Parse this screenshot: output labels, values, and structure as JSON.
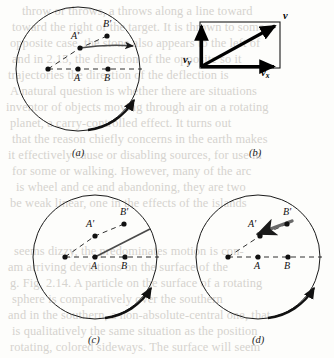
{
  "figure": {
    "background_color": "#fdfdfb",
    "ink_color": "#1a1a1a",
    "width": 334,
    "height": 358
  },
  "panels": [
    {
      "id": "a",
      "label": "(a)",
      "label_x": 72,
      "label_y": 147,
      "type": "rotating-disk",
      "circle": {
        "cx": 78,
        "cy": 69,
        "r": 62
      },
      "points": [
        {
          "name": "center",
          "label": "",
          "x": 48,
          "y": 69
        },
        {
          "name": "A",
          "label": "A",
          "x": 78,
          "y": 69,
          "label_x": 74,
          "label_y": 72
        },
        {
          "name": "B",
          "label": "B",
          "x": 108,
          "y": 69,
          "label_x": 104,
          "label_y": 72
        },
        {
          "name": "A-prime",
          "label": "A'",
          "x": 80,
          "y": 48,
          "label_x": 71,
          "label_y": 30
        },
        {
          "name": "B-prime",
          "label": "B'",
          "x": 107,
          "y": 36,
          "label_x": 103,
          "label_y": 18
        }
      ],
      "rotation_arrow": "counterclockwise-bottom-right",
      "motion_arrow": "curved-right-from-A-prime"
    },
    {
      "id": "b",
      "label": "(b)",
      "label_x": 249,
      "label_y": 147,
      "type": "vector-decomposition",
      "rect": {
        "x": 200,
        "y": 22,
        "w": 80,
        "h": 46
      },
      "vectors": [
        {
          "name": "v",
          "label": "v",
          "subscript": "",
          "label_x": 283,
          "label_y": 14
        },
        {
          "name": "v-y",
          "label": "v",
          "subscript": "y",
          "label_x": 183,
          "label_y": 58
        },
        {
          "name": "v-x",
          "label": "v",
          "subscript": "x",
          "label_x": 261,
          "label_y": 71
        }
      ]
    },
    {
      "id": "c",
      "label": "(c)",
      "label_x": 88,
      "label_y": 334,
      "type": "rotating-disk",
      "circle": {
        "cx": 95,
        "cy": 257,
        "r": 62
      },
      "points": [
        {
          "name": "center",
          "label": "",
          "x": 65,
          "y": 257
        },
        {
          "name": "A",
          "label": "A",
          "x": 95,
          "y": 257,
          "label_x": 91,
          "label_y": 260
        },
        {
          "name": "B",
          "label": "B",
          "x": 125,
          "y": 257,
          "label_x": 121,
          "label_y": 260
        },
        {
          "name": "A-prime",
          "label": "A'",
          "x": 95,
          "y": 236,
          "label_x": 86,
          "label_y": 218
        },
        {
          "name": "B-prime",
          "label": "B'",
          "x": 124,
          "y": 224,
          "label_x": 120,
          "label_y": 206
        }
      ],
      "rotation_arrow": "counterclockwise-bottom-right",
      "motion_arrow": "straight-from-A-to-rim"
    },
    {
      "id": "d",
      "label": "(d)",
      "label_x": 252,
      "label_y": 334,
      "type": "rotating-disk",
      "circle": {
        "cx": 258,
        "cy": 257,
        "r": 62
      },
      "points": [
        {
          "name": "center",
          "label": "",
          "x": 228,
          "y": 257
        },
        {
          "name": "A",
          "label": "A",
          "x": 258,
          "y": 257,
          "label_x": 254,
          "label_y": 260
        },
        {
          "name": "B",
          "label": "B",
          "x": 288,
          "y": 257,
          "label_x": 284,
          "label_y": 260
        },
        {
          "name": "A-prime",
          "label": "A'",
          "x": 260,
          "y": 236,
          "label_x": 248,
          "label_y": 218
        },
        {
          "name": "B-prime",
          "label": "B'",
          "x": 287,
          "y": 224,
          "label_x": 283,
          "label_y": 206
        }
      ],
      "rotation_arrow": "counterclockwise-bottom-right",
      "motion_arrow": "curved-left-toward-A-prime"
    }
  ],
  "background_text": {
    "note": "faint show-through of body text from the reverse side of the page",
    "lines": [
      {
        "x": 22,
        "y": 3,
        "text": "throw or throws, a throws along a line toward"
      },
      {
        "x": 12,
        "y": 19,
        "text": "toward the right of the target. It is thrown to some"
      },
      {
        "x": 10,
        "y": 35,
        "text": "opposite case, the stone also appears to the left of"
      },
      {
        "x": 12,
        "y": 51,
        "text": "and in 2.15, the direction of the opposite so it"
      },
      {
        "x": 8,
        "y": 67,
        "text": "trajectories the direction of the deflection is"
      },
      {
        "x": 10,
        "y": 83,
        "text": "A natural question is whether there are situations"
      },
      {
        "x": 6,
        "y": 99,
        "text": "inventor of objects moving through air on a rotating"
      },
      {
        "x": 10,
        "y": 115,
        "text": "planet, a carry-controlled effect. It turns out"
      },
      {
        "x": 12,
        "y": 131,
        "text": "that the reason chiefly concerns in the earth makes"
      },
      {
        "x": 8,
        "y": 147,
        "text": "it effectively cause or disabling sources, for use in"
      },
      {
        "x": 12,
        "y": 163,
        "text": "for some or walking. However, many of the arc"
      },
      {
        "x": 16,
        "y": 179,
        "text": "is wheel and ce and abandoning, they are two"
      },
      {
        "x": 10,
        "y": 195,
        "text": "be weak linear, one in the effects of the islands"
      },
      {
        "x": 14,
        "y": 243,
        "text": "seems dizzy, the predominates motion is con-"
      },
      {
        "x": 8,
        "y": 259,
        "text": "am arriving deviations on the surface of the"
      },
      {
        "x": 10,
        "y": 275,
        "text": "g. Fig. 2.14. A particle on the surface of a rotating"
      },
      {
        "x": 12,
        "y": 291,
        "text": "sphere is comparatively over the southern"
      },
      {
        "x": 8,
        "y": 307,
        "text": "and in the southern, a non-absolute-central one, that"
      },
      {
        "x": 12,
        "y": 323,
        "text": "is qualitatively the same situation as the position"
      },
      {
        "x": 10,
        "y": 339,
        "text": "rotating, colored sideways. The surface will seem"
      }
    ]
  }
}
